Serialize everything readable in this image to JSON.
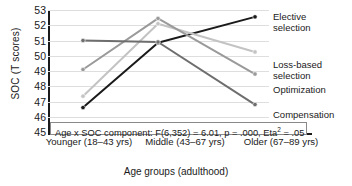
{
  "chart_data": {
    "type": "line",
    "title": "",
    "xlabel": "Age groups (adulthood)",
    "ylabel": "SOC (T scores)",
    "categories": [
      "Younger (18–43 yrs)",
      "Middle (43–67 yrs)",
      "Older (67–89 yrs)"
    ],
    "ylim": [
      45,
      53
    ],
    "yticks": [
      45,
      46,
      47,
      48,
      49,
      50,
      51,
      52,
      53
    ],
    "grid": true,
    "legend_position": "right",
    "series": [
      {
        "name": "Elective selection",
        "values": [
          46.6,
          50.85,
          52.55
        ],
        "color": "#1a1a1a",
        "markers": true
      },
      {
        "name": "Loss-based selection",
        "values": [
          47.35,
          52.1,
          50.25
        ],
        "color": "#c3c3c3",
        "markers": true
      },
      {
        "name": "Optimization",
        "values": [
          49.1,
          52.45,
          48.8
        ],
        "color": "#9a9a9a",
        "markers": true
      },
      {
        "name": "Compensation",
        "values": [
          51.0,
          50.9,
          46.8
        ],
        "color": "#6e6e6e",
        "markers": true
      }
    ],
    "annotation": "Age x SOC component: F(6,352) = 6.01, p = .000, Eta",
    "annotation_sup": "2",
    "annotation_tail": " = .05"
  },
  "legend": {
    "items": [
      {
        "label_line1": "Elective",
        "label_line2": "selection"
      },
      {
        "label_line1": "Loss-based",
        "label_line2": "selection"
      },
      {
        "label_line1": "Optimization",
        "label_line2": ""
      },
      {
        "label_line1": "Compensation",
        "label_line2": ""
      }
    ]
  }
}
